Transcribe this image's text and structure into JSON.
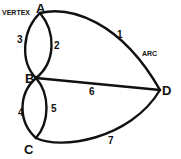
{
  "diagram": {
    "type": "graph",
    "vertices": [
      {
        "id": "A",
        "label": "A"
      },
      {
        "id": "B",
        "label": "B"
      },
      {
        "id": "C",
        "label": "C"
      },
      {
        "id": "D",
        "label": "D"
      }
    ],
    "edges": [
      {
        "id": "1",
        "label": "1",
        "from": "A",
        "to": "D"
      },
      {
        "id": "2",
        "label": "2",
        "from": "A",
        "to": "B"
      },
      {
        "id": "3",
        "label": "3",
        "from": "A",
        "to": "B"
      },
      {
        "id": "4",
        "label": "4",
        "from": "B",
        "to": "C"
      },
      {
        "id": "5",
        "label": "5",
        "from": "B",
        "to": "C"
      },
      {
        "id": "6",
        "label": "6",
        "from": "B",
        "to": "D"
      },
      {
        "id": "7",
        "label": "7",
        "from": "C",
        "to": "D"
      }
    ],
    "annotations": {
      "vertex": "VERTEX",
      "arc": "ARC"
    }
  }
}
